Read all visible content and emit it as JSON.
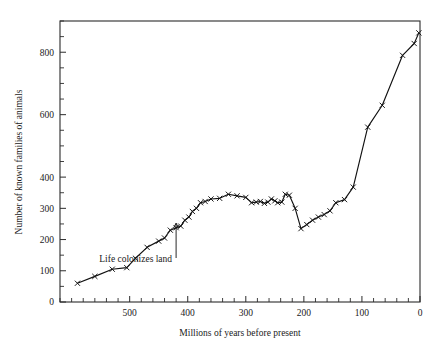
{
  "chart_data": {
    "type": "line",
    "title": "",
    "xlabel": "Millions of years before present",
    "ylabel": "Number of known families of animals",
    "xlim": [
      620,
      0
    ],
    "ylim": [
      0,
      900
    ],
    "x_reversed": true,
    "grid": false,
    "legend": "none",
    "marker": "x",
    "xticks_major": [
      500,
      400,
      300,
      200,
      100,
      0
    ],
    "xticklabels": [
      "500",
      "400",
      "300",
      "200",
      "100",
      "0"
    ],
    "xticks_minor_step": 20,
    "yticks_major": [
      0,
      100,
      200,
      300,
      400,
      600,
      800
    ],
    "yticklabels": [
      "0",
      "100",
      "200",
      "300",
      "400",
      "600",
      "800"
    ],
    "yticks_minor_step": 50,
    "annotations": [
      {
        "text": "Life colonizes land",
        "x": 420,
        "y": 250,
        "points_to_x": 420,
        "points_to_y": 262
      }
    ],
    "series": [
      {
        "name": "Known families of animals",
        "x": [
          590,
          560,
          530,
          505,
          490,
          470,
          450,
          440,
          430,
          420,
          412,
          405,
          398,
          392,
          385,
          378,
          370,
          360,
          345,
          330,
          315,
          300,
          290,
          282,
          275,
          268,
          262,
          256,
          250,
          245,
          238,
          232,
          225,
          215,
          205,
          195,
          185,
          175,
          165,
          155,
          145,
          130,
          115,
          90,
          65,
          30,
          10,
          2
        ],
        "y": [
          60,
          82,
          105,
          110,
          140,
          175,
          195,
          205,
          230,
          238,
          243,
          262,
          272,
          290,
          300,
          318,
          322,
          330,
          332,
          345,
          340,
          335,
          318,
          320,
          322,
          316,
          320,
          330,
          324,
          318,
          320,
          345,
          342,
          300,
          235,
          248,
          262,
          272,
          280,
          292,
          318,
          328,
          368,
          560,
          630,
          790,
          828,
          862
        ]
      }
    ]
  },
  "axes": {
    "ylabel": "Number of known families of animals",
    "xlabel": "Millions of years before present"
  }
}
